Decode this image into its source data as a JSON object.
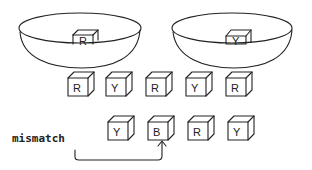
{
  "bowls": [
    {
      "id": "left",
      "block_letter": "R"
    },
    {
      "id": "right",
      "block_letter": "Y"
    }
  ],
  "top_row": [
    "R",
    "Y",
    "R",
    "Y",
    "R"
  ],
  "bottom_row": [
    "Y",
    "B",
    "R",
    "Y"
  ],
  "annotation": {
    "label": "mismatch",
    "points_to_index": 1
  }
}
